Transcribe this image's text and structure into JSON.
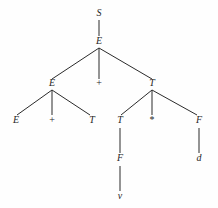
{
  "figure": {
    "kind": "parse-tree",
    "background_color": "#fefefe",
    "ink_color": "#2b2b2b"
  },
  "nodes": [
    {
      "id": "n0",
      "label": "S",
      "kind": "nonterminal",
      "x": 99,
      "y": 16,
      "level": 0
    },
    {
      "id": "n1",
      "label": "E",
      "kind": "nonterminal",
      "x": 99,
      "y": 44,
      "level": 1
    },
    {
      "id": "n2",
      "label": "E",
      "kind": "nonterminal",
      "x": 52,
      "y": 86,
      "level": 2
    },
    {
      "id": "n3",
      "label": "+",
      "kind": "terminal",
      "x": 99,
      "y": 86,
      "level": 2
    },
    {
      "id": "n4",
      "label": "T",
      "kind": "nonterminal",
      "x": 152,
      "y": 86,
      "level": 2
    },
    {
      "id": "n5",
      "label": "E",
      "kind": "nonterminal",
      "x": 16,
      "y": 123,
      "level": 3
    },
    {
      "id": "n6",
      "label": "+",
      "kind": "terminal",
      "x": 52,
      "y": 123,
      "level": 3
    },
    {
      "id": "n7",
      "label": "T",
      "kind": "nonterminal",
      "x": 92,
      "y": 123,
      "level": 3
    },
    {
      "id": "n8",
      "label": "T",
      "kind": "nonterminal",
      "x": 120,
      "y": 123,
      "level": 3
    },
    {
      "id": "n9",
      "label": "*",
      "kind": "terminal",
      "x": 152,
      "y": 123,
      "level": 3
    },
    {
      "id": "n10",
      "label": "F",
      "kind": "nonterminal",
      "x": 199,
      "y": 123,
      "level": 3
    },
    {
      "id": "n11",
      "label": "F",
      "kind": "nonterminal",
      "x": 120,
      "y": 161,
      "level": 4
    },
    {
      "id": "n12",
      "label": "d",
      "kind": "terminal",
      "x": 199,
      "y": 161,
      "level": 4
    },
    {
      "id": "n13",
      "label": "v",
      "kind": "terminal",
      "x": 120,
      "y": 199,
      "level": 5
    }
  ],
  "edges": [
    {
      "from": "n0",
      "to": "n1",
      "x1": 99,
      "y1": 20,
      "x2": 99,
      "y2": 36
    },
    {
      "from": "n1",
      "to": "n2",
      "x1": 99,
      "y1": 48,
      "x2": 52,
      "y2": 79
    },
    {
      "from": "n1",
      "to": "n3",
      "x1": 99,
      "y1": 48,
      "x2": 99,
      "y2": 79
    },
    {
      "from": "n1",
      "to": "n4",
      "x1": 99,
      "y1": 48,
      "x2": 152,
      "y2": 79
    },
    {
      "from": "n2",
      "to": "n5",
      "x1": 52,
      "y1": 90,
      "x2": 17,
      "y2": 115
    },
    {
      "from": "n2",
      "to": "n6",
      "x1": 52,
      "y1": 90,
      "x2": 52,
      "y2": 115
    },
    {
      "from": "n2",
      "to": "n7",
      "x1": 52,
      "y1": 90,
      "x2": 90,
      "y2": 115
    },
    {
      "from": "n4",
      "to": "n8",
      "x1": 152,
      "y1": 90,
      "x2": 121,
      "y2": 115
    },
    {
      "from": "n4",
      "to": "n9",
      "x1": 152,
      "y1": 90,
      "x2": 152,
      "y2": 115
    },
    {
      "from": "n4",
      "to": "n10",
      "x1": 152,
      "y1": 90,
      "x2": 197,
      "y2": 115
    },
    {
      "from": "n8",
      "to": "n11",
      "x1": 120,
      "y1": 128,
      "x2": 120,
      "y2": 153
    },
    {
      "from": "n10",
      "to": "n12",
      "x1": 199,
      "y1": 128,
      "x2": 199,
      "y2": 153
    },
    {
      "from": "n11",
      "to": "n13",
      "x1": 120,
      "y1": 166,
      "x2": 120,
      "y2": 191
    }
  ],
  "derivation": {
    "root": "S",
    "string": "E + T * F",
    "leaves": [
      "E",
      "+",
      "T",
      "T",
      "*",
      "F",
      "d",
      "v"
    ]
  }
}
